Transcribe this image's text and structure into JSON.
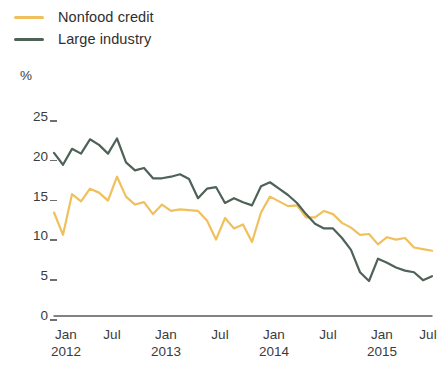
{
  "legend": {
    "items": [
      {
        "label": "Nonfood credit",
        "color": "#EFC05C",
        "key": "nonfood-credit"
      },
      {
        "label": "Large industry",
        "color": "#4F6257",
        "key": "large-industry"
      }
    ]
  },
  "axis": {
    "y_unit": "%",
    "y_ticks": [
      "25",
      "20",
      "15",
      "10",
      "5",
      "0"
    ],
    "x_ticks": [
      {
        "month": "Jan",
        "year": "2012"
      },
      {
        "month": "Jul",
        "year": ""
      },
      {
        "month": "Jan",
        "year": "2013"
      },
      {
        "month": "Jul",
        "year": ""
      },
      {
        "month": "Jan",
        "year": "2014"
      },
      {
        "month": "Jul",
        "year": ""
      },
      {
        "month": "Jan",
        "year": "2015"
      },
      {
        "month": "Jul",
        "year": ""
      }
    ]
  },
  "chart_data": {
    "type": "line",
    "title": "",
    "subtitle": "",
    "xlabel": "",
    "ylabel": "%",
    "ylim": [
      0,
      25
    ],
    "yticks": [
      0,
      5,
      10,
      15,
      20,
      25
    ],
    "grid": false,
    "legend_position": "top-left",
    "x_tick_labels": [
      "Jan 2012",
      "Jul",
      "Jan 2013",
      "Jul",
      "Jan 2014",
      "Jul",
      "Jan 2015",
      "Jul"
    ],
    "x": [
      "2012-01",
      "2012-02",
      "2012-03",
      "2012-04",
      "2012-05",
      "2012-06",
      "2012-07",
      "2012-08",
      "2012-09",
      "2012-10",
      "2012-11",
      "2012-12",
      "2013-01",
      "2013-02",
      "2013-03",
      "2013-04",
      "2013-05",
      "2013-06",
      "2013-07",
      "2013-08",
      "2013-09",
      "2013-10",
      "2013-11",
      "2013-12",
      "2014-01",
      "2014-02",
      "2014-03",
      "2014-04",
      "2014-05",
      "2014-06",
      "2014-07",
      "2014-08",
      "2014-09",
      "2014-10",
      "2014-11",
      "2014-12",
      "2015-01",
      "2015-02",
      "2015-03",
      "2015-04",
      "2015-05",
      "2015-06",
      "2015-07"
    ],
    "series": [
      {
        "name": "Nonfood credit",
        "color": "#EFC05C",
        "values": [
          13.0,
          10.2,
          15.3,
          14.4,
          16.0,
          15.5,
          14.5,
          17.5,
          15.0,
          14.0,
          14.3,
          12.8,
          14.0,
          13.2,
          13.4,
          13.3,
          13.2,
          12.0,
          9.6,
          12.3,
          11.0,
          11.5,
          9.3,
          13.0,
          15.0,
          14.4,
          13.8,
          13.9,
          12.4,
          12.4,
          13.2,
          12.8,
          11.7,
          11.1,
          10.2,
          10.3,
          9.0,
          9.9,
          9.6,
          9.8,
          8.6,
          8.4,
          8.2
        ]
      },
      {
        "name": "Large industry",
        "color": "#4F6257",
        "values": [
          20.5,
          19.0,
          21.0,
          20.4,
          22.2,
          21.5,
          20.4,
          22.3,
          19.3,
          18.3,
          18.6,
          17.3,
          17.3,
          17.5,
          17.8,
          17.2,
          14.8,
          16.0,
          16.2,
          14.2,
          14.8,
          14.3,
          13.9,
          16.3,
          16.8,
          16.0,
          15.2,
          14.2,
          12.8,
          11.6,
          11.0,
          11.0,
          9.8,
          8.3,
          5.5,
          4.4,
          7.2,
          6.7,
          6.1,
          5.7,
          5.5,
          4.5,
          5.0
        ]
      }
    ]
  },
  "geometry": {
    "plot_left": 54,
    "plot_right": 432,
    "y_zero_px": 316,
    "y_top_px": 117,
    "y_top_value": 25
  }
}
